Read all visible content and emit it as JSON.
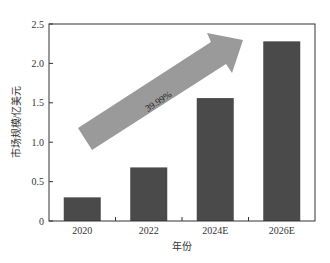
{
  "caption": "",
  "chart_data": {
    "type": "bar",
    "title": "",
    "categories": [
      "2020",
      "2022",
      "2024E",
      "2026E"
    ],
    "values": [
      0.3,
      0.68,
      1.56,
      2.28
    ],
    "xlabel": "年份",
    "ylabel": "市场规模/亿美元",
    "ylim": [
      0,
      2.5
    ],
    "yticks": [
      "0",
      "0.5",
      "1.0",
      "1.5",
      "2.0",
      "2.5"
    ],
    "grid": false,
    "legend": null,
    "bar_color": "#4a4a4a",
    "annotations": [
      {
        "type": "block-arrow",
        "text": "39.99%",
        "color": "#9a9a9a",
        "meaning": "growth rate (CAGR) trend arrow"
      }
    ]
  }
}
